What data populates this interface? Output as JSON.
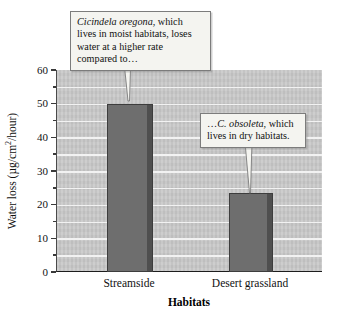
{
  "chart_data": {
    "type": "bar",
    "title": "",
    "categories": [
      "Streamside",
      "Desert grassland"
    ],
    "values": [
      50,
      23.5
    ],
    "series": [
      {
        "name": "Water loss",
        "values": [
          50,
          23.5
        ]
      }
    ],
    "xlabel": "Habitats",
    "ylabel": "Water loss (µg/cm2/hour)",
    "ylabel_parts": {
      "pre": "Water loss (µg/cm",
      "sup": "2",
      "post": "/hour)"
    },
    "ylim": [
      0,
      60
    ],
    "ytick_values": [
      0,
      10,
      20,
      30,
      40,
      50,
      60
    ],
    "ytick_labels": [
      "0",
      "10",
      "20",
      "30",
      "40",
      "50",
      "60"
    ],
    "minor_tick_step": 5,
    "grid": true,
    "grid_step": 5,
    "legend": "none",
    "bar_color": "#6e6e6e",
    "plot_background": "#c9c9c9",
    "annotations": [
      {
        "id": "callout-1",
        "target_category": "Streamside",
        "species": "Cicindela oregona",
        "text_rest": ", which lives in moist habitats, loses water at a higher rate compared to…",
        "full_text": "Cicindela oregona, which lives in moist habitats, loses water at a higher rate compared to…"
      },
      {
        "id": "callout-2",
        "target_category": "Desert grassland",
        "prefix": "…",
        "species": "C. obsoleta",
        "text_rest": ", which lives in dry habitats.",
        "full_text": "…C. obsoleta, which lives in dry habitats."
      }
    ]
  },
  "figure": {
    "alt": "Bar chart comparing water loss of two tiger beetle species across habitats"
  }
}
